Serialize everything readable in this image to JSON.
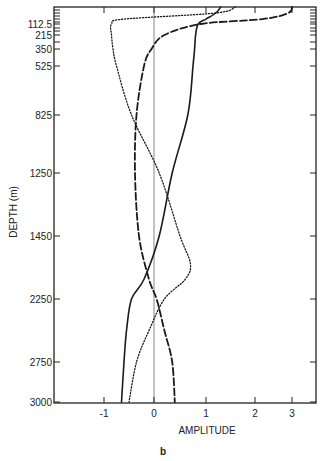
{
  "chart_data": {
    "type": "line",
    "title": "",
    "panel_label": "b",
    "xlabel": "AMPLITUDE",
    "ylabel": "DEPTH (m)",
    "x_ticks": [
      -1,
      0,
      1,
      2,
      3
    ],
    "x_tick_labels": [
      "-1",
      "0",
      "1",
      "2",
      "3"
    ],
    "y_tick_labels": [
      "112.5",
      "215",
      "350",
      "525",
      "825",
      "1250",
      "1450",
      "2250",
      "2750",
      "3000"
    ],
    "y_ticks": [
      112.5,
      215,
      350,
      525,
      825,
      1250,
      1450,
      2250,
      2750,
      3000
    ],
    "ylim": [
      0,
      3000
    ],
    "xlim": [
      -2,
      3.5
    ],
    "y_inverted": true,
    "grid": false,
    "legend": "none",
    "reference_line": {
      "x": 0,
      "style": "thin vertical"
    },
    "series": [
      {
        "name": "solid",
        "style": "solid",
        "points": [
          [
            1.3,
            0
          ],
          [
            1.2,
            40
          ],
          [
            1.0,
            80
          ],
          [
            0.85,
            112.5
          ],
          [
            0.8,
            215
          ],
          [
            0.78,
            350
          ],
          [
            0.75,
            525
          ],
          [
            0.65,
            825
          ],
          [
            0.35,
            1250
          ],
          [
            0.1,
            1450
          ],
          [
            -0.2,
            2000
          ],
          [
            -0.45,
            2250
          ],
          [
            -0.55,
            2500
          ],
          [
            -0.6,
            2750
          ],
          [
            -0.65,
            3000
          ]
        ]
      },
      {
        "name": "dashed",
        "style": "dashed",
        "points": [
          [
            3.0,
            0
          ],
          [
            2.9,
            40
          ],
          [
            2.2,
            80
          ],
          [
            0.9,
            112.5
          ],
          [
            0.2,
            215
          ],
          [
            -0.05,
            350
          ],
          [
            -0.2,
            525
          ],
          [
            -0.35,
            825
          ],
          [
            -0.38,
            1250
          ],
          [
            -0.3,
            1450
          ],
          [
            -0.1,
            2000
          ],
          [
            0.05,
            2250
          ],
          [
            0.2,
            2500
          ],
          [
            0.35,
            2750
          ],
          [
            0.4,
            3000
          ]
        ]
      },
      {
        "name": "dotted",
        "style": "dotted",
        "points": [
          [
            1.6,
            0
          ],
          [
            1.2,
            40
          ],
          [
            -0.6,
            80
          ],
          [
            -0.85,
            112.5
          ],
          [
            -0.85,
            215
          ],
          [
            -0.82,
            350
          ],
          [
            -0.75,
            525
          ],
          [
            -0.45,
            825
          ],
          [
            0.1,
            1250
          ],
          [
            0.5,
            1450
          ],
          [
            0.7,
            1800
          ],
          [
            0.6,
            2000
          ],
          [
            0.2,
            2250
          ],
          [
            -0.1,
            2500
          ],
          [
            -0.35,
            2750
          ],
          [
            -0.5,
            3000
          ]
        ]
      }
    ]
  }
}
